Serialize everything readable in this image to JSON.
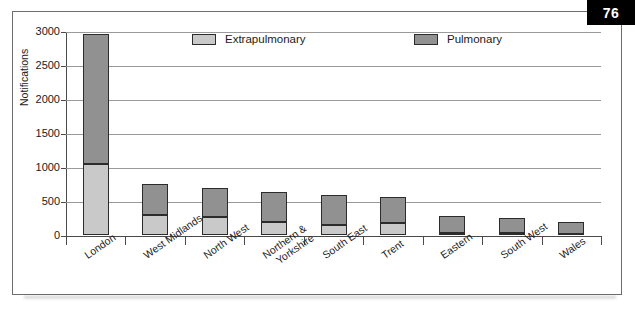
{
  "page": {
    "badge_number": "76"
  },
  "chart_data": {
    "type": "bar",
    "subtype": "stacked-bar",
    "title": "",
    "xlabel": "",
    "ylabel": "Notifications",
    "ylim": [
      0,
      3000
    ],
    "ytick_step": 500,
    "yticks": [
      0,
      500,
      1000,
      1500,
      2000,
      2500,
      3000
    ],
    "ytick_labels": [
      "0",
      "500",
      "1000",
      "1500",
      "2000",
      "2500",
      "3000"
    ],
    "grid": true,
    "grid_axis": "y",
    "legend_position": "top-inside",
    "categories": [
      "London",
      "West Midlands",
      "North West",
      "Northern &\nYorkshire",
      "South East",
      "Trent",
      "Eastern",
      "South West",
      "Wales"
    ],
    "category_labels": [
      {
        "line1": "London",
        "line2": ""
      },
      {
        "line1": "West Midlands",
        "line2": ""
      },
      {
        "line1": "North West",
        "line2": ""
      },
      {
        "line1": "Northern &",
        "line2": "Yorkshire"
      },
      {
        "line1": "South East",
        "line2": ""
      },
      {
        "line1": "Trent",
        "line2": ""
      },
      {
        "line1": "Eastern",
        "line2": ""
      },
      {
        "line1": "South West",
        "line2": ""
      },
      {
        "line1": "Wales",
        "line2": ""
      }
    ],
    "series": [
      {
        "name": "Extrapulmonary",
        "color": "#c9c9c9",
        "values": [
          1050,
          290,
          265,
          185,
          150,
          175,
          35,
          25,
          20
        ]
      },
      {
        "name": "Pulmonary",
        "color": "#919191",
        "values": [
          1900,
          460,
          420,
          450,
          440,
          390,
          250,
          220,
          175
        ]
      }
    ],
    "totals": [
      2950,
      750,
      685,
      635,
      590,
      565,
      285,
      245,
      195
    ]
  },
  "legend": {
    "items": [
      {
        "label": "Extrapulmonary",
        "color": "#c9c9c9"
      },
      {
        "label": "Pulmonary",
        "color": "#919191"
      }
    ]
  },
  "colors": {
    "extrapulmonary": "#c9c9c9",
    "pulmonary": "#919191",
    "axis": "#4a4a4a",
    "grid": "#9a9a9a",
    "badge_bg": "#000000",
    "badge_text": "#ffffff",
    "frame_border": "#6d6d6d"
  }
}
